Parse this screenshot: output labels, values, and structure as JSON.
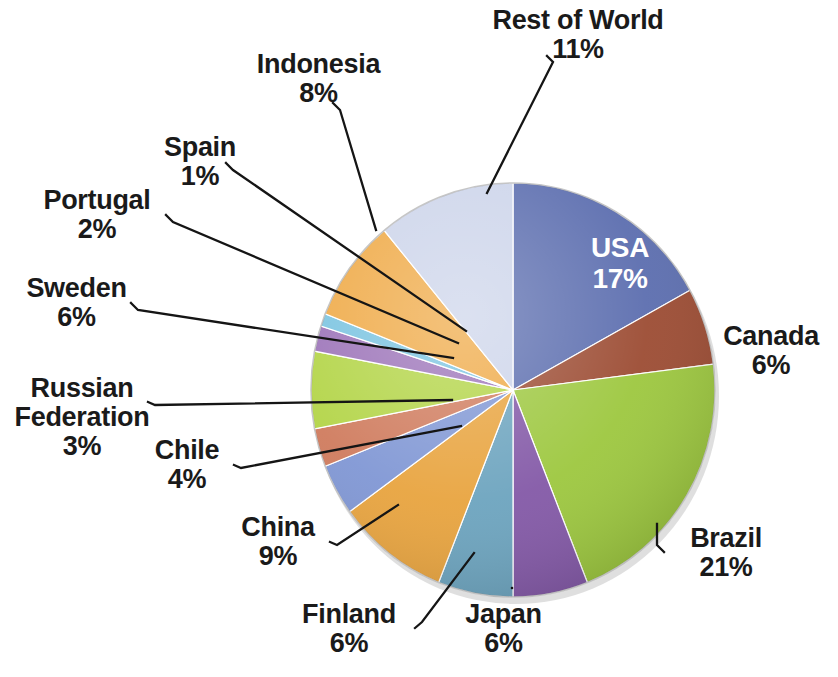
{
  "chart_data": {
    "type": "pie",
    "title": "",
    "subtitle": "",
    "xlabel": "",
    "ylabel": "",
    "units": "percent",
    "legend_position": "none",
    "grid": false,
    "label_format": "name + percent",
    "total": 100,
    "categories": [
      "USA",
      "Canada",
      "Brazil",
      "Japan",
      "Finland",
      "China",
      "Chile",
      "Russian Federation",
      "Sweden",
      "Portugal",
      "Spain",
      "Indonesia",
      "Rest of World"
    ],
    "values": [
      17,
      6,
      21,
      6,
      6,
      9,
      4,
      3,
      6,
      2,
      1,
      8,
      11
    ],
    "slices": [
      {
        "name": "USA",
        "value": 17,
        "label": "USA",
        "pct": "17%",
        "color": "#5a6cae",
        "label_placement": "inside",
        "label_color": "#ffffff"
      },
      {
        "name": "Canada",
        "value": 6,
        "label": "Canada",
        "pct": "6%",
        "color": "#9b4a31",
        "label_placement": "outside-right"
      },
      {
        "name": "Brazil",
        "value": 21,
        "label": "Brazil",
        "pct": "21%",
        "color": "#9cc73d",
        "label_placement": "outside-right"
      },
      {
        "name": "Japan",
        "value": 6,
        "label": "Japan",
        "pct": "6%",
        "color": "#8257a6",
        "label_placement": "outside-bottom"
      },
      {
        "name": "Finland",
        "value": 6,
        "label": "Finland",
        "pct": "6%",
        "color": "#6ba3be",
        "label_placement": "outside-bottom"
      },
      {
        "name": "China",
        "value": 9,
        "label": "China",
        "pct": "9%",
        "color": "#e8a33d",
        "label_placement": "outside-left"
      },
      {
        "name": "Chile",
        "value": 4,
        "label": "Chile",
        "pct": "4%",
        "color": "#7f96d4",
        "label_placement": "outside-left"
      },
      {
        "name": "Russian Federation",
        "value": 3,
        "label": "Russian Federation",
        "pct": "3%",
        "color": "#cf7a5c",
        "label_placement": "outside-left"
      },
      {
        "name": "Sweden",
        "value": 6,
        "label": "Sweden",
        "pct": "6%",
        "color": "#b2d445",
        "label_placement": "outside-left"
      },
      {
        "name": "Portugal",
        "value": 2,
        "label": "Portugal",
        "pct": "2%",
        "color": "#9b72b8",
        "label_placement": "outside-left"
      },
      {
        "name": "Spain",
        "value": 1,
        "label": "Spain",
        "pct": "1%",
        "color": "#79c3e0",
        "label_placement": "outside-left"
      },
      {
        "name": "Indonesia",
        "value": 8,
        "label": "Indonesia",
        "pct": "8%",
        "color": "#efa945",
        "label_placement": "outside-top"
      },
      {
        "name": "Rest of World",
        "value": 11,
        "label": "Rest of World",
        "pct": "11%",
        "color": "#ccd4ea",
        "label_placement": "outside-top"
      }
    ]
  },
  "labels": {
    "usa": {
      "name": "USA",
      "pct": "17%"
    },
    "canada": {
      "name": "Canada",
      "pct": "6%"
    },
    "brazil": {
      "name": "Brazil",
      "pct": "21%"
    },
    "japan": {
      "name": "Japan",
      "pct": "6%"
    },
    "finland": {
      "name": "Finland",
      "pct": "6%"
    },
    "china": {
      "name": "China",
      "pct": "9%"
    },
    "chile": {
      "name": "Chile",
      "pct": "4%"
    },
    "russia": {
      "name": "Russian",
      "name2": "Federation",
      "pct": "3%"
    },
    "sweden": {
      "name": "Sweden",
      "pct": "6%"
    },
    "portugal": {
      "name": "Portugal",
      "pct": "2%"
    },
    "spain": {
      "name": "Spain",
      "pct": "1%"
    },
    "indonesia": {
      "name": "Indonesia",
      "pct": "8%"
    },
    "rest_of_world": {
      "name": "Rest of World",
      "pct": "11%"
    }
  },
  "colors": {
    "background": "#ffffff",
    "label_text": "#1a1a1a",
    "leader_line": "#1a1a1a",
    "inside_label_text": "#ffffff"
  }
}
